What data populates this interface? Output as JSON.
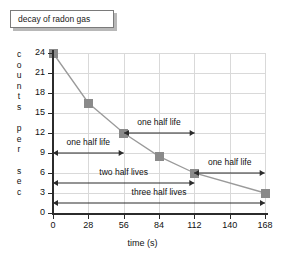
{
  "title": {
    "text": "decay of radon gas"
  },
  "chart_data": {
    "type": "line",
    "title": "decay of radon gas",
    "xlabel": "time (s)",
    "ylabel": "counts per sec",
    "ylabel_letters": [
      "c",
      "o",
      "u",
      "n",
      "t",
      "s",
      "",
      "p",
      "e",
      "r",
      "",
      "s",
      "e",
      "c"
    ],
    "x": [
      0,
      28,
      56,
      84,
      112,
      168
    ],
    "values": [
      24,
      16.5,
      12,
      8.5,
      6,
      3
    ],
    "xticks": [
      0,
      28,
      56,
      84,
      112,
      140,
      168
    ],
    "yticks": [
      0,
      3,
      6,
      9,
      12,
      15,
      18,
      21,
      24
    ],
    "xlim": [
      0,
      168
    ],
    "ylim": [
      0,
      24
    ],
    "grid": true,
    "legend": null,
    "marker_color": "#8a8a8a",
    "line_color": "#9a9a9a",
    "annotations": [
      {
        "label": "one half life",
        "x0": 0,
        "x1": 56,
        "y": 9
      },
      {
        "label": "one half life",
        "x0": 56,
        "x1": 112,
        "y": 12
      },
      {
        "label": "one half life",
        "x0": 112,
        "x1": 168,
        "y": 6
      },
      {
        "label": "two half lives",
        "x0": 0,
        "x1": 112,
        "y": 4.5
      },
      {
        "label": "three half lives",
        "x0": 0,
        "x1": 168,
        "y": 1.5
      }
    ]
  }
}
